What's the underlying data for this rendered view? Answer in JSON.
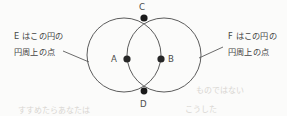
{
  "figure": {
    "background_color": "#fbfbfa",
    "stroke_color": "#4a4a4a",
    "dot_color": "#262626"
  },
  "annotations": {
    "left": {
      "line1": "E はこの円の",
      "line2": "円周上の点"
    },
    "right": {
      "line1": "F はこの円の",
      "line2": "円周上の点"
    }
  },
  "points": {
    "A": {
      "label": "A",
      "role": "center-of-left-circle",
      "x": 127,
      "y": 59
    },
    "B": {
      "label": "B",
      "role": "center-of-right-circle",
      "x": 161,
      "y": 59
    },
    "C": {
      "label": "C",
      "role": "upper-intersection",
      "x": 144,
      "y": 18
    },
    "D": {
      "label": "D",
      "role": "lower-intersection",
      "x": 144,
      "y": 91
    }
  },
  "circles": {
    "left": {
      "cx": 124,
      "cy": 55,
      "r": 37
    },
    "right": {
      "cx": 164,
      "cy": 55,
      "r": 37
    }
  },
  "leaders": {
    "left": {
      "x1": 63,
      "y1": 51,
      "x2": 89,
      "y2": 62
    },
    "right": {
      "x1": 223,
      "y1": 47,
      "x2": 199,
      "y2": 58
    }
  },
  "artifacts": {
    "smudge1": "すすめたらあなたは",
    "smudge2": "こうした",
    "smudge3": "ものではない"
  }
}
